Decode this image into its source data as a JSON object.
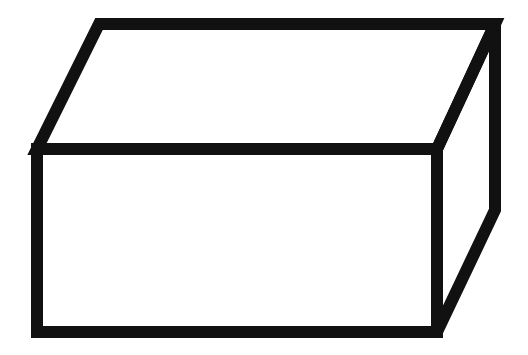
{
  "figure": {
    "stroke_color": "#111111",
    "background_color": "#ffffff",
    "stroke_width": 12,
    "vertices": {
      "front_top_left": [
        37,
        149
      ],
      "front_top_right": [
        437,
        149
      ],
      "front_bottom_right": [
        437,
        332
      ],
      "front_bottom_left": [
        37,
        332
      ],
      "back_top_left": [
        99,
        24
      ],
      "back_top_right": [
        495,
        24
      ],
      "back_bottom_right": [
        495,
        210
      ]
    }
  }
}
